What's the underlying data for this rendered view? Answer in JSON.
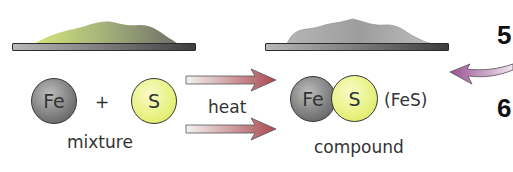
{
  "diagram": {
    "type": "chemistry-mixture-vs-compound",
    "mixture": {
      "atoms": [
        "Fe",
        "S"
      ],
      "operator": "+",
      "label": "mixture",
      "pile_colors": [
        "#c9dd7a",
        "#8a8a7a"
      ]
    },
    "process": {
      "label": "heat",
      "arrow_color": "#a9494f"
    },
    "compound": {
      "atoms": [
        "Fe",
        "S"
      ],
      "formula": "(FeS)",
      "label": "compound",
      "pile_color": "#b8b8b8"
    },
    "side_numbers": [
      "5",
      "6"
    ],
    "side_arrow_color": "#a05a9a",
    "colors": {
      "iron": "#7a7a7a",
      "sulfur": "#e6f07a"
    }
  }
}
